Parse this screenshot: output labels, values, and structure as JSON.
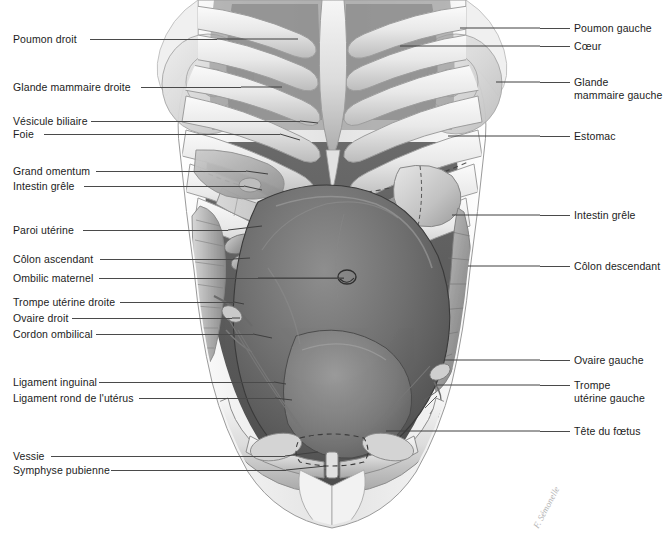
{
  "figure": {
    "background_color": "#ffffff",
    "text_color": "#1c1c1c",
    "leader_color": "#4a4a4a",
    "width": 663,
    "height": 540
  },
  "signature": {
    "text": "F. Sémonelle",
    "color": "#9a9a9a"
  },
  "labels_left": [
    {
      "text": "Poumon droit",
      "x": 13,
      "y": 33,
      "leader_x": 90,
      "leader_w": 127,
      "leader_y": 39
    },
    {
      "text": "Glande mammaire droite",
      "x": 13,
      "y": 81,
      "leader_x": 141,
      "leader_w": 100,
      "leader_y": 87
    },
    {
      "text": "Vésicule biliaire",
      "x": 13,
      "y": 115,
      "leader_x": 91,
      "leader_w": 209,
      "leader_y": 121
    },
    {
      "text": "Foie",
      "x": 13,
      "y": 128,
      "leader_x": 44,
      "leader_w": 236,
      "leader_y": 134
    },
    {
      "text": "Grand omentum",
      "x": 13,
      "y": 165,
      "leader_x": 96,
      "leader_w": 150,
      "leader_y": 171
    },
    {
      "text": "Intestin grêle",
      "x": 13,
      "y": 180,
      "leader_x": 84,
      "leader_w": 160,
      "leader_y": 186
    },
    {
      "text": "Paroi utérine",
      "x": 13,
      "y": 224,
      "leader_x": 83,
      "leader_w": 145,
      "leader_y": 230
    },
    {
      "text": "Côlon ascendant",
      "x": 13,
      "y": 253,
      "leader_x": 100,
      "leader_w": 133,
      "leader_y": 259
    },
    {
      "text": "Ombilic maternel",
      "x": 13,
      "y": 272,
      "leader_x": 99,
      "leader_w": 245,
      "leader_y": 278
    },
    {
      "text": "Trompe utérine droite",
      "x": 13,
      "y": 296,
      "leader_x": 120,
      "leader_w": 114,
      "leader_y": 302
    },
    {
      "text": "Ovaire droit",
      "x": 13,
      "y": 312,
      "leader_x": 72,
      "leader_w": 160,
      "leader_y": 318
    },
    {
      "text": "Cordon ombilical",
      "x": 13,
      "y": 328,
      "leader_x": 96,
      "leader_w": 157,
      "leader_y": 334
    },
    {
      "text": "Ligament inguinal",
      "x": 13,
      "y": 376,
      "leader_x": 99,
      "leader_w": 175,
      "leader_y": 382
    },
    {
      "text": "Ligament rond de l'utérus",
      "x": 13,
      "y": 392,
      "leader_x": 139,
      "leader_w": 136,
      "leader_y": 398
    },
    {
      "text": "Vessie",
      "x": 13,
      "y": 450,
      "leader_x": 51,
      "leader_w": 234,
      "leader_y": 456
    },
    {
      "text": "Symphyse pubienne",
      "x": 13,
      "y": 464,
      "leader_x": 111,
      "leader_w": 175,
      "leader_y": 470
    }
  ],
  "labels_right": [
    {
      "text": "Poumon gauche",
      "x": 574,
      "y": 22,
      "leader_x": 540,
      "leader_w": 30,
      "leader_y": 28,
      "lines": 1
    },
    {
      "text": "Cœur",
      "x": 574,
      "y": 40,
      "leader_x": 540,
      "leader_w": 30,
      "leader_y": 46,
      "lines": 1
    },
    {
      "text": "Glande\nmammaire gauche",
      "x": 574,
      "y": 76,
      "leader_x": 540,
      "leader_w": 30,
      "leader_y": 82,
      "lines": 2
    },
    {
      "text": "Estomac",
      "x": 574,
      "y": 130,
      "leader_x": 540,
      "leader_w": 30,
      "leader_y": 136,
      "lines": 1
    },
    {
      "text": "Intestin grêle",
      "x": 574,
      "y": 209,
      "leader_x": 540,
      "leader_w": 30,
      "leader_y": 215,
      "lines": 1
    },
    {
      "text": "Côlon descendant",
      "x": 574,
      "y": 260,
      "leader_x": 540,
      "leader_w": 30,
      "leader_y": 266,
      "lines": 1
    },
    {
      "text": "Ovaire gauche",
      "x": 574,
      "y": 354,
      "leader_x": 540,
      "leader_w": 30,
      "leader_y": 360,
      "lines": 1
    },
    {
      "text": "Trompe\nutérine gauche",
      "x": 574,
      "y": 379,
      "leader_x": 540,
      "leader_w": 30,
      "leader_y": 385,
      "lines": 2
    },
    {
      "text": "Tête du fœtus",
      "x": 574,
      "y": 425,
      "leader_x": 540,
      "leader_w": 30,
      "leader_y": 431,
      "lines": 1
    }
  ]
}
